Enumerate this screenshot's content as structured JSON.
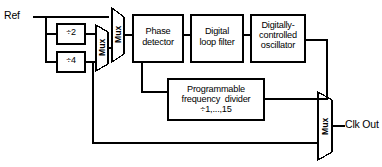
{
  "diagram": {
    "type": "block-diagram",
    "stroke_color": "#000000",
    "background_color": "#ffffff"
  },
  "inputs": {
    "ref": "Ref"
  },
  "outputs": {
    "clk_out": "Clk Out"
  },
  "prescalers": [
    {
      "id": "div2",
      "label": "÷2"
    },
    {
      "id": "div4",
      "label": "÷4"
    }
  ],
  "multiplexers": [
    {
      "id": "mux-prescaler",
      "label": "Mux"
    },
    {
      "id": "mux-reference",
      "label": "Mux"
    },
    {
      "id": "mux-output",
      "label": "Mux"
    }
  ],
  "blocks": [
    {
      "id": "phase-detector",
      "lines": [
        "Phase",
        "detector"
      ]
    },
    {
      "id": "digital-loop-filter",
      "lines": [
        "Digital",
        "loop filter"
      ]
    },
    {
      "id": "dco",
      "lines": [
        "Digitally-",
        "controlled",
        "oscillator"
      ]
    },
    {
      "id": "frequency-divider",
      "lines": [
        "Programmable",
        "frequency  divider",
        "÷1,...,15"
      ]
    }
  ]
}
